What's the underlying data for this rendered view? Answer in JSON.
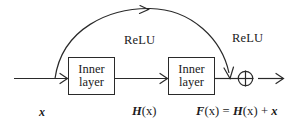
{
  "diagram": {
    "stroke_color": "#2a2a2a",
    "background_color": "#ffffff",
    "boxes": [
      {
        "name": "inner-layer-box-1",
        "line1": "Inner",
        "line2": "layer"
      },
      {
        "name": "inner-layer-box-2",
        "line1": "Inner",
        "line2": "layer"
      }
    ],
    "activation_labels": [
      {
        "name": "relu-label-1",
        "text": "ReLU"
      },
      {
        "name": "relu-label-2",
        "text": "ReLU"
      }
    ],
    "operator": {
      "name": "addition-operator",
      "symbol": "plus-circle"
    },
    "signal_labels": {
      "input": "x",
      "intermediate_fn": "H",
      "intermediate_arg": "(x)",
      "output_fn": "F",
      "output_arg": "(x)",
      "output_equals": " = ",
      "output_term1_fn": "H",
      "output_term1_arg": "(x)",
      "output_plus": " + ",
      "output_term2": "x"
    }
  }
}
